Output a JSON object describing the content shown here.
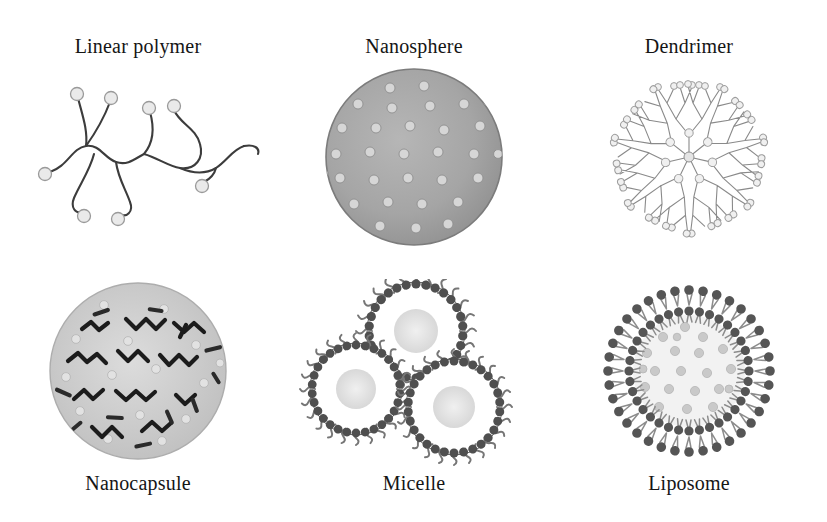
{
  "figure": {
    "title": "",
    "background_color": "#ffffff",
    "columns": 3,
    "rows": 2,
    "label_color": "#151515"
  },
  "palette": {
    "ink": "#3c3c3c",
    "dark_ink": "#202020",
    "nanosphere_fill": "#a5a5a5",
    "nanosphere_dot": "#d6d6d6",
    "nanocapsule_fill": "#c8c8c8",
    "nanocapsule_chain": "#1c1c1c",
    "nanocapsule_dot": "#e0e0e0",
    "dendrimer_branch": "#8a8a8a",
    "dendrimer_node": "#a0a0a0",
    "micelle_head": "#4f4f4f",
    "micelle_tail": "#6e6e6e",
    "micelle_core": "#e2e2e2",
    "liposome_head": "#555555",
    "liposome_tail": "#8c8c8c",
    "liposome_lumen": "#f2f2f2",
    "liposome_cargo": "#c9c9c9",
    "polymer_bead": "#eaeaea",
    "polymer_bead_stroke": "#9a9a9a"
  },
  "panels": [
    {
      "id": "linear-polymer",
      "label": "Linear polymer",
      "row": "top",
      "column": 0,
      "art": "linear-polymer-illustration",
      "description": "branched polymer chains with terminal drug beads"
    },
    {
      "id": "nanosphere",
      "label": "Nanosphere",
      "row": "top",
      "column": 1,
      "art": "nanosphere-illustration",
      "description": "solid gray matrix sphere with dispersed drug particles"
    },
    {
      "id": "dendrimer",
      "label": "Dendrimer",
      "row": "top",
      "column": 2,
      "art": "dendrimer-illustration",
      "description": "radially branched generations with terminal groups"
    },
    {
      "id": "nanocapsule",
      "label": "Nanocapsule",
      "row": "bottom",
      "column": 0,
      "art": "nanocapsule-illustration",
      "description": "light shell enclosing dark zigzag polymer chains"
    },
    {
      "id": "micelle",
      "label": "Micelle",
      "row": "bottom",
      "column": 1,
      "art": "micelle-illustration",
      "description": "three surfactant micelles with inward facing tails"
    },
    {
      "id": "liposome",
      "label": "Liposome",
      "row": "bottom",
      "column": 2,
      "art": "liposome-illustration",
      "description": "phospholipid bilayer vesicle with aqueous cargo core"
    }
  ]
}
